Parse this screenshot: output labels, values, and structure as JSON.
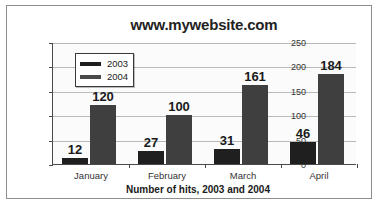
{
  "chart_data": {
    "type": "bar",
    "title": "www.mywebsite.com",
    "xlabel": "Number of hits, 2003 and 2004",
    "ylabel": "",
    "categories": [
      "January",
      "February",
      "March",
      "April"
    ],
    "series": [
      {
        "name": "2003",
        "values": [
          12,
          27,
          31,
          46
        ],
        "color": "#1f1f1f"
      },
      {
        "name": "2004",
        "values": [
          120,
          100,
          161,
          184
        ],
        "color": "#3f3f3f"
      }
    ],
    "ylim": [
      0,
      250
    ],
    "yticks": [
      0,
      50,
      100,
      150,
      200,
      250
    ],
    "grid": "horizontal",
    "legend_position": "top-left-inside",
    "data_labels": true
  },
  "legend": {
    "entries": [
      {
        "label": "2003"
      },
      {
        "label": "2004"
      }
    ]
  },
  "colors": {
    "series_2003": "#1f1f1f",
    "series_2004": "#3f3f3f",
    "gridline": "#b9b9b9",
    "axis": "#4a4a4a",
    "frame": "#8e8e8e",
    "plot_background": "#fbfbfb"
  }
}
